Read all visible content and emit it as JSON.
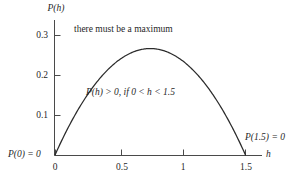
{
  "figure": {
    "background_color": "#ffffff",
    "ink_color": "#333333",
    "curve_color": "#2b2b2b"
  },
  "axes": {
    "y_axis_label": "P(h)",
    "x_axis_label": "h",
    "x_ticks": [
      "0",
      "0.5",
      "1",
      "1.5"
    ],
    "y_ticks": [
      "0.1",
      "0.2",
      "0.3"
    ]
  },
  "annotations": {
    "maximum_note": "there must be a maximum",
    "positivity_note_a": "P",
    "positivity_note_b": "(h)",
    "positivity_note_c": " > 0, if 0 < ",
    "positivity_note_d": "h",
    "positivity_note_e": " < 1.5",
    "positivity_note_full": "P(h) > 0, if 0 < h < 1.5",
    "zero_left": "P(0) = 0",
    "zero_right": "P(1.5) = 0"
  },
  "chart_data": {
    "type": "line",
    "title": "",
    "xlabel": "h",
    "ylabel": "P(h)",
    "xlim": [
      0,
      1.6
    ],
    "ylim": [
      0,
      0.33
    ],
    "xticks": [
      0,
      0.5,
      1,
      1.5
    ],
    "xticklabels": [
      "0",
      "0.5",
      "1",
      "1.5"
    ],
    "yticks": [
      0.1,
      0.2,
      0.3
    ],
    "yticklabels": [
      "0.1",
      "0.2",
      "0.3"
    ],
    "grid": false,
    "legend": false,
    "series": [
      {
        "name": "P(h)",
        "equation": "P(h) = 0.475 * h * (1.5 - h)",
        "roots": [
          0.0,
          1.5
        ],
        "maximum": {
          "h": 0.75,
          "P": 0.267
        },
        "x": [
          0.0,
          0.075,
          0.15,
          0.225,
          0.3,
          0.375,
          0.45,
          0.525,
          0.6,
          0.675,
          0.75,
          0.825,
          0.9,
          0.975,
          1.05,
          1.125,
          1.2,
          1.275,
          1.35,
          1.425,
          1.5
        ],
        "y": [
          0.0,
          0.0508,
          0.0961,
          0.1363,
          0.171,
          0.2004,
          0.2244,
          0.2431,
          0.2565,
          0.2645,
          0.2672,
          0.2645,
          0.2565,
          0.2431,
          0.2244,
          0.2004,
          0.171,
          0.1363,
          0.0961,
          0.0508,
          0.0
        ]
      }
    ],
    "point_labels": [
      {
        "text": "P(0) = 0",
        "x": 0.0,
        "y": 0.0
      },
      {
        "text": "P(1.5) = 0",
        "x": 1.5,
        "y": 0.0
      }
    ],
    "text_annotations": [
      {
        "text": "there must be a maximum",
        "x": 0.42,
        "y": 0.315
      },
      {
        "text": "P(h) > 0, if 0 < h < 1.5",
        "x": 0.62,
        "y": 0.175
      }
    ]
  }
}
